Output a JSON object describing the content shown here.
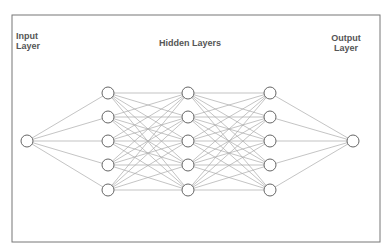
{
  "labels": {
    "input": [
      "Input",
      "Layer"
    ],
    "hidden": "Hidden Layers",
    "output": [
      "Output",
      "Layer"
    ]
  },
  "frame": {
    "x": 12,
    "y": 15,
    "width": 368,
    "height": 227,
    "stroke": "#777777"
  },
  "style": {
    "edge_color": "#aaaaaa",
    "node_stroke": "#666666",
    "node_fill": "#ffffff",
    "node_radius": 6
  },
  "layers": [
    {
      "name": "input",
      "x": 27,
      "nodes_y": [
        141
      ]
    },
    {
      "name": "hidden-1",
      "x": 108,
      "nodes_y": [
        93,
        117,
        141,
        165,
        190
      ]
    },
    {
      "name": "hidden-2",
      "x": 188,
      "nodes_y": [
        93,
        117,
        141,
        165,
        190
      ]
    },
    {
      "name": "hidden-3",
      "x": 270,
      "nodes_y": [
        93,
        117,
        141,
        165,
        190
      ]
    },
    {
      "name": "output",
      "x": 353,
      "nodes_y": [
        141
      ]
    }
  ]
}
